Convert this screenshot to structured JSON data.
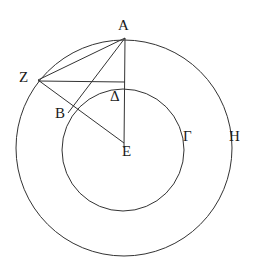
{
  "figure": {
    "kind": "geometry-diagram",
    "width": 265,
    "height": 277,
    "background_color": "#ffffff",
    "stroke_color": "#333333",
    "label_color": "#1a1a1a",
    "stroke_width": 1
  },
  "circles": [
    {
      "name": "outer-circle",
      "label": "H",
      "cx": 124,
      "cy": 148,
      "r": 108
    },
    {
      "name": "inner-circle",
      "label": "Γ",
      "cx": 123,
      "cy": 150,
      "r": 61
    }
  ],
  "points": [
    {
      "id": "A",
      "label": "Α",
      "x": 125,
      "y": 38,
      "label_x": 118,
      "label_y": 18
    },
    {
      "id": "Z",
      "label": "Ζ",
      "x": 38,
      "y": 80,
      "label_x": 19,
      "label_y": 70
    },
    {
      "id": "B",
      "label": "Β",
      "x": 74,
      "y": 104,
      "label_x": 55,
      "label_y": 106
    },
    {
      "id": "D",
      "label": "Δ",
      "x": 125,
      "y": 89,
      "label_x": 110,
      "label_y": 89
    },
    {
      "id": "E",
      "label": "Ε",
      "x": 124,
      "y": 143,
      "label_x": 122,
      "label_y": 144
    },
    {
      "id": "G",
      "label": "Γ",
      "x": 182,
      "y": 140,
      "label_x": 183,
      "label_y": 129
    },
    {
      "id": "H",
      "label": "Η",
      "x": 228,
      "y": 140,
      "label_x": 229,
      "label_y": 129
    }
  ],
  "segments": [
    {
      "name": "segment-A-E",
      "from": "A",
      "to": "E",
      "x1": 125,
      "y1": 38,
      "x2": 124,
      "y2": 148
    },
    {
      "name": "segment-A-Z",
      "from": "A",
      "to": "Z",
      "x1": 125,
      "y1": 38,
      "x2": 38,
      "y2": 80
    },
    {
      "name": "segment-A-B",
      "from": "A",
      "to": "B",
      "x1": 125,
      "y1": 38,
      "x2": 68,
      "y2": 113
    },
    {
      "name": "segment-Z-E",
      "from": "Z",
      "to": "E",
      "x1": 38,
      "y1": 80,
      "x2": 124,
      "y2": 143
    },
    {
      "name": "segment-Z-D",
      "from": "Z",
      "to": "D",
      "x1": 38,
      "y1": 81,
      "x2": 125,
      "y2": 82
    }
  ],
  "labels_text": {
    "A": "Α",
    "B": "Β",
    "G": "Γ",
    "D": "Δ",
    "E": "Ε",
    "Z": "Ζ",
    "H": "Η"
  }
}
